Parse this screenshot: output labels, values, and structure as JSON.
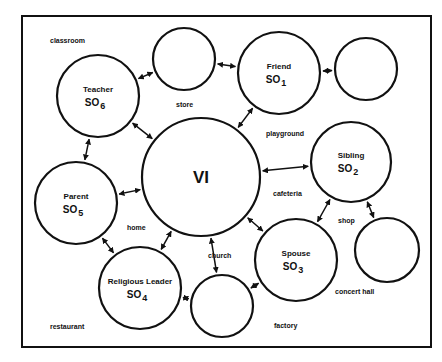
{
  "diagram": {
    "center": {
      "label": "VI",
      "cx": 201,
      "cy": 177,
      "r": 59
    },
    "nodes": [
      {
        "id": "friend",
        "role": "Friend",
        "so": "SO",
        "sub": "1",
        "cx": 279,
        "cy": 73,
        "r": 41
      },
      {
        "id": "sibling",
        "role": "Sibling",
        "so": "SO",
        "sub": "2",
        "cx": 351,
        "cy": 162,
        "r": 40
      },
      {
        "id": "spouse",
        "role": "Spouse",
        "so": "SO",
        "sub": "3",
        "cx": 296,
        "cy": 260,
        "r": 41
      },
      {
        "id": "religious-leader",
        "role": "Religious Leader",
        "so": "SO",
        "sub": "4",
        "cx": 140,
        "cy": 288,
        "r": 41
      },
      {
        "id": "parent",
        "role": "Parent",
        "so": "SO",
        "sub": "5",
        "cx": 76,
        "cy": 203,
        "r": 41
      },
      {
        "id": "teacher",
        "role": "Teacher",
        "so": "SO",
        "sub": "6",
        "cx": 98,
        "cy": 96,
        "r": 41
      }
    ],
    "empty_nodes": [
      {
        "id": "empty-top",
        "cx": 184,
        "cy": 59,
        "r": 31
      },
      {
        "id": "empty-top-right",
        "cx": 366,
        "cy": 69,
        "r": 31
      },
      {
        "id": "empty-right",
        "cx": 387,
        "cy": 250,
        "r": 32
      },
      {
        "id": "empty-bottom",
        "cx": 222,
        "cy": 306,
        "r": 31
      }
    ],
    "places": [
      {
        "text": "classroom",
        "x": 50,
        "y": 43
      },
      {
        "text": "store",
        "x": 176,
        "y": 107
      },
      {
        "text": "playground",
        "x": 266,
        "y": 136
      },
      {
        "text": "cafeteria",
        "x": 273,
        "y": 196
      },
      {
        "text": "shop",
        "x": 338,
        "y": 223
      },
      {
        "text": "home",
        "x": 127,
        "y": 230
      },
      {
        "text": "church",
        "x": 208,
        "y": 258
      },
      {
        "text": "concert hall",
        "x": 335,
        "y": 294
      },
      {
        "text": "restaurant",
        "x": 50,
        "y": 329
      },
      {
        "text": "factory",
        "x": 274,
        "y": 328
      }
    ]
  }
}
